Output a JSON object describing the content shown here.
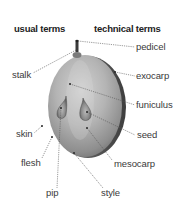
{
  "headings": {
    "usual": "usual terms",
    "technical": "technical terms"
  },
  "labels": {
    "usual": [
      {
        "id": "stalk",
        "text": "stalk"
      },
      {
        "id": "skin",
        "text": "skin"
      },
      {
        "id": "flesh",
        "text": "flesh"
      },
      {
        "id": "pip",
        "text": "pip"
      }
    ],
    "technical": [
      {
        "id": "pedicel",
        "text": "pedicel"
      },
      {
        "id": "exocarp",
        "text": "exocarp"
      },
      {
        "id": "funiculus",
        "text": "funiculus"
      },
      {
        "id": "seed",
        "text": "seed"
      },
      {
        "id": "mesocarp",
        "text": "mesocarp"
      },
      {
        "id": "style",
        "text": "style"
      }
    ]
  },
  "illustration": {
    "subject": "grape-cross-section",
    "colors": {
      "fruit_light": "#c9c9c9",
      "fruit_mid": "#9a9a9a",
      "fruit_dark": "#5a5a5a",
      "rim": "#4a4a4a",
      "leader_line": "#555555"
    }
  }
}
